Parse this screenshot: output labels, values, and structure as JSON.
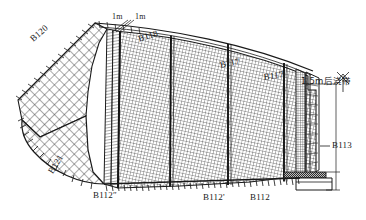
{
  "drawing": {
    "type": "engineering-plan",
    "description": "Curved fan-shaped reinforced concrete slab plan divided into pour zones with mesh reinforcement hatching",
    "background_color": "#ffffff",
    "line_color": "#1a1a1a",
    "hatch_color": "#333333"
  },
  "labels": {
    "zone_b120": "B120",
    "zone_b121": "B121",
    "zone_b118": "B118",
    "zone_b117": "B117",
    "zone_b117_prime": "B117'",
    "zone_b112": "B112",
    "zone_b112_prime": "B112'",
    "zone_b112_dprime": "B112″",
    "zone_b113": "B113"
  },
  "dimensions": {
    "dim_1m_left": "1m",
    "dim_1m_right": "1m",
    "post_cast_strip": "1.5m后浇带"
  }
}
